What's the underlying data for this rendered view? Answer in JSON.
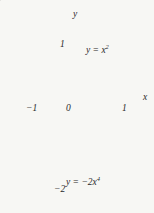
{
  "figure": {
    "title": "",
    "background_color": "#f7f7f4",
    "shade_color": "#e2e2e0",
    "upper_curve_color": "#3a3a3a",
    "lower_curve_color": "#9a9a9a",
    "axis_color": "#6f6f6f"
  },
  "axes": {
    "x_axis_label": "x",
    "y_axis_label": "y",
    "origin_label": "0",
    "x_ticks": [
      {
        "value": -1,
        "label": "−1"
      },
      {
        "value": 1,
        "label": "1"
      }
    ],
    "y_ticks": [
      {
        "value": 1,
        "label": "1"
      },
      {
        "value": -2,
        "label": "−2"
      }
    ],
    "xlim": [
      -1.38,
      1.38
    ],
    "ylim": [
      -2.32,
      1.55
    ]
  },
  "chart_data": {
    "type": "line",
    "title": "",
    "xlabel": "x",
    "ylabel": "y",
    "xlim": [
      -1.38,
      1.38
    ],
    "ylim": [
      -2.32,
      1.55
    ],
    "grid": false,
    "legend": "inline annotations",
    "shaded_region": {
      "description": "Region between y = x² and y = −2x⁴ from x = −1 to x = 1",
      "x_from": -1,
      "x_to": 1,
      "upper_boundary": "y = x^2",
      "lower_boundary": "y = -2x^4",
      "fill_color": "#e2e2e0"
    },
    "series": [
      {
        "name": "y = x²",
        "expression": "x^2",
        "label_text": "y = x",
        "label_exponent": "2",
        "color": "#3a3a3a",
        "x": [
          -1,
          -0.9,
          -0.8,
          -0.7,
          -0.6,
          -0.5,
          -0.4,
          -0.3,
          -0.2,
          -0.1,
          0,
          0.1,
          0.2,
          0.3,
          0.4,
          0.5,
          0.6,
          0.7,
          0.8,
          0.9,
          1
        ],
        "values": [
          1,
          0.81,
          0.64,
          0.49,
          0.36,
          0.25,
          0.16,
          0.09,
          0.04,
          0.01,
          0,
          0.01,
          0.04,
          0.09,
          0.16,
          0.25,
          0.36,
          0.49,
          0.64,
          0.81,
          1
        ]
      },
      {
        "name": "y = −2x⁴",
        "expression": "-2x^4",
        "label_text": "y = −2x",
        "label_exponent": "4",
        "color": "#9a9a9a",
        "x": [
          -1,
          -0.9,
          -0.8,
          -0.7,
          -0.6,
          -0.5,
          -0.4,
          -0.3,
          -0.2,
          -0.1,
          0,
          0.1,
          0.2,
          0.3,
          0.4,
          0.5,
          0.6,
          0.7,
          0.8,
          0.9,
          1
        ],
        "values": [
          -2,
          -1.312,
          -0.819,
          -0.48,
          -0.259,
          -0.125,
          -0.051,
          -0.016,
          -0.0032,
          -0.0002,
          0,
          -0.0002,
          -0.0032,
          -0.016,
          -0.051,
          -0.125,
          -0.259,
          -0.48,
          -0.819,
          -1.312,
          -2
        ]
      }
    ],
    "annotations": [
      {
        "text": "y = x²",
        "x": 0.45,
        "y": 0.95
      },
      {
        "text": "y = −2x⁴",
        "x": -0.1,
        "y": -1.8
      }
    ]
  }
}
